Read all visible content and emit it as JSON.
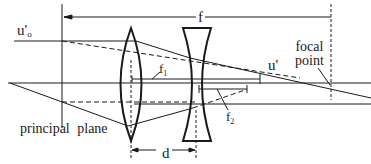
{
  "figure": {
    "type": "optical-diagram",
    "stroke_color": "#1a1a1a",
    "background": "#ffffff"
  },
  "labels": {
    "u0_prime_main": "u'",
    "u0_prime_sub": "o",
    "f": "f",
    "f1_main": "f",
    "f1_sub": "1",
    "f2_main": "f",
    "f2_sub": "2",
    "u_prime": "u'",
    "focal_point_line1": "focal",
    "focal_point_line2": "point",
    "principal_plane": "principal plane",
    "d": "d"
  },
  "elements": {
    "converging_lens": {
      "shape": "biconvex",
      "x": 131,
      "top": 28,
      "bottom": 141
    },
    "diverging_lens": {
      "shape": "biconcave",
      "x": 196,
      "top": 28,
      "bottom": 141
    },
    "principal_plane_x": 62,
    "focal_point_x": 331,
    "optical_axis_y": 83
  }
}
